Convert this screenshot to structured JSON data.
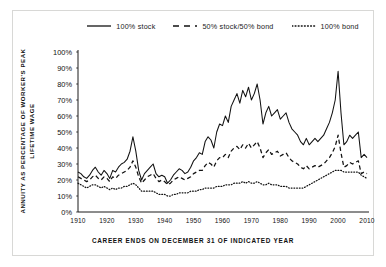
{
  "figure": {
    "ylabel": "ANNUITY AS PERCENTAGE OF WORKER'S PEAK LIFETIME WAGE",
    "xlabel": "CAREER ENDS ON DECEMBER 31 OF INDICATED YEAR"
  },
  "legend": {
    "items": [
      {
        "label": "100% stock",
        "style": "solid",
        "icon": "solid-line-icon"
      },
      {
        "label": "50% stock/50% bond",
        "style": "dashed",
        "icon": "dashed-line-icon"
      },
      {
        "label": "100% bond",
        "style": "dotted",
        "icon": "dotted-line-icon"
      }
    ]
  },
  "chart_data": {
    "type": "line",
    "title": "",
    "xlabel": "CAREER ENDS ON DECEMBER 31 OF INDICATED YEAR",
    "ylabel": "ANNUITY AS PERCENTAGE OF WORKER'S PEAK LIFETIME WAGE",
    "xlim": [
      1910,
      2010
    ],
    "ylim": [
      0,
      100
    ],
    "grid": false,
    "legend_position": "top-center",
    "xticks": [
      1910,
      1920,
      1930,
      1940,
      1950,
      1960,
      1970,
      1980,
      1990,
      2000,
      2010
    ],
    "xtick_labels": [
      "1910",
      "1920",
      "1930",
      "1940",
      "1950",
      "1960",
      "1970",
      "1980",
      "1990",
      "2000",
      "2010"
    ],
    "yticks": [
      0,
      10,
      20,
      30,
      40,
      50,
      60,
      70,
      80,
      90,
      100
    ],
    "ytick_labels": [
      "0%",
      "10%",
      "20%",
      "30%",
      "40%",
      "50%",
      "60%",
      "70%",
      "80%",
      "90%",
      "100%"
    ],
    "x": [
      1910,
      1911,
      1912,
      1913,
      1914,
      1915,
      1916,
      1917,
      1918,
      1919,
      1920,
      1921,
      1922,
      1923,
      1924,
      1925,
      1926,
      1927,
      1928,
      1929,
      1930,
      1931,
      1932,
      1933,
      1934,
      1935,
      1936,
      1937,
      1938,
      1939,
      1940,
      1941,
      1942,
      1943,
      1944,
      1945,
      1946,
      1947,
      1948,
      1949,
      1950,
      1951,
      1952,
      1953,
      1954,
      1955,
      1956,
      1957,
      1958,
      1959,
      1960,
      1961,
      1962,
      1963,
      1964,
      1965,
      1966,
      1967,
      1968,
      1969,
      1970,
      1971,
      1972,
      1973,
      1974,
      1975,
      1976,
      1977,
      1978,
      1979,
      1980,
      1981,
      1982,
      1983,
      1984,
      1985,
      1986,
      1987,
      1988,
      1989,
      1990,
      1991,
      1992,
      1993,
      1994,
      1995,
      1996,
      1997,
      1998,
      1999,
      2000,
      2001,
      2002,
      2003,
      2004,
      2005,
      2006,
      2007,
      2008,
      2009,
      2010
    ],
    "series": [
      {
        "name": "100% stock",
        "style": "solid",
        "color": "#111111",
        "values": [
          25,
          24,
          22,
          21,
          23,
          26,
          28,
          25,
          23,
          26,
          24,
          21,
          26,
          25,
          28,
          30,
          31,
          33,
          38,
          47,
          38,
          26,
          20,
          24,
          26,
          28,
          30,
          24,
          22,
          23,
          22,
          18,
          20,
          23,
          25,
          27,
          26,
          24,
          25,
          28,
          32,
          34,
          37,
          36,
          44,
          47,
          45,
          40,
          50,
          55,
          54,
          60,
          56,
          66,
          70,
          74,
          68,
          76,
          72,
          78,
          70,
          74,
          80,
          70,
          55,
          62,
          66,
          60,
          62,
          64,
          58,
          60,
          62,
          56,
          52,
          50,
          48,
          44,
          42,
          46,
          42,
          44,
          46,
          44,
          46,
          48,
          52,
          56,
          62,
          70,
          88,
          62,
          42,
          44,
          48,
          46,
          48,
          50,
          34,
          36,
          34
        ]
      },
      {
        "name": "50% stock/50% bond",
        "style": "dashed",
        "color": "#111111",
        "values": [
          22,
          21,
          20,
          19,
          20,
          22,
          23,
          21,
          20,
          22,
          21,
          19,
          22,
          21,
          23,
          24,
          25,
          26,
          28,
          32,
          28,
          22,
          18,
          20,
          22,
          23,
          24,
          21,
          19,
          20,
          19,
          17,
          18,
          20,
          21,
          22,
          21,
          20,
          21,
          22,
          24,
          25,
          26,
          26,
          29,
          31,
          30,
          28,
          32,
          34,
          34,
          36,
          34,
          38,
          40,
          41,
          39,
          42,
          40,
          43,
          40,
          42,
          44,
          40,
          34,
          37,
          39,
          36,
          37,
          38,
          35,
          36,
          37,
          34,
          32,
          31,
          30,
          28,
          27,
          29,
          27,
          28,
          29,
          28,
          29,
          30,
          32,
          34,
          37,
          41,
          48,
          37,
          28,
          29,
          31,
          30,
          31,
          32,
          24,
          25,
          24
        ]
      },
      {
        "name": "100% bond",
        "style": "dotted",
        "color": "#111111",
        "values": [
          18,
          17,
          16,
          15,
          16,
          17,
          17,
          16,
          15,
          16,
          15,
          14,
          15,
          14,
          15,
          15,
          16,
          16,
          17,
          18,
          17,
          15,
          13,
          13,
          13,
          13,
          13,
          12,
          11,
          11,
          11,
          10,
          10,
          11,
          11,
          12,
          12,
          12,
          12,
          13,
          13,
          13,
          14,
          14,
          15,
          15,
          15,
          15,
          16,
          16,
          16,
          17,
          17,
          17,
          18,
          18,
          18,
          19,
          18,
          19,
          18,
          18,
          19,
          18,
          17,
          17,
          18,
          17,
          17,
          17,
          16,
          16,
          16,
          15,
          15,
          15,
          15,
          15,
          15,
          16,
          17,
          18,
          19,
          20,
          21,
          22,
          23,
          24,
          25,
          26,
          26,
          26,
          25,
          25,
          25,
          25,
          25,
          25,
          23,
          22,
          21
        ]
      }
    ]
  }
}
